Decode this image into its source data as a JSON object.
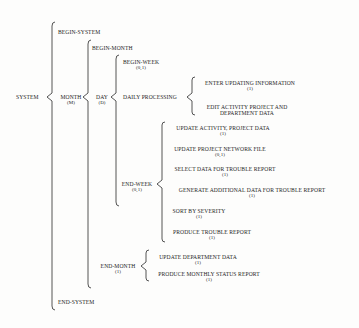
{
  "diagram": {
    "type": "Warnier-Orr diagram",
    "root": {
      "label": "SYSTEM"
    },
    "system": {
      "begin": "BEGIN-SYSTEM",
      "month": {
        "label": "MONTH",
        "rep": "(M)"
      },
      "end": "END-SYSTEM"
    },
    "month": {
      "begin": "BEGIN-MONTH",
      "day": {
        "label": "DAY",
        "rep": "(D)"
      },
      "end_month": {
        "label": "END-MONTH",
        "rep": "(1)"
      }
    },
    "day": {
      "begin_week": {
        "label": "BEGIN-WEEK",
        "rep": "(0,1)"
      },
      "daily_processing": {
        "label": "DAILY PROCESSING"
      },
      "end_week": {
        "label": "END-WEEK",
        "rep": "(0,1)"
      }
    },
    "daily_processing": {
      "items": [
        {
          "label": "ENTER UPDATING INFORMATION",
          "rep": "(1)"
        },
        {
          "label": "EDIT ACTIVITY PROJECT AND",
          "label2": "DEPARTMENT DATA"
        }
      ]
    },
    "end_week": {
      "items": [
        {
          "label": "UPDATE ACTIVITY, PROJECT DATA",
          "rep": "(1)"
        },
        {
          "label": "UPDATE PROJECT NETWORK FILE",
          "rep": "(0,1)"
        },
        {
          "label": "SELECT DATA FOR TROUBLE REPORT",
          "rep": "(1)"
        },
        {
          "label": "GENERATE ADDITIONAL DATA FOR TROUBLE REPORT",
          "rep": "(1)"
        },
        {
          "label": "SORT BY SEVERITY",
          "rep": "(1)"
        },
        {
          "label": "PRODUCE TROUBLE REPORT",
          "rep": "(1)"
        }
      ]
    },
    "end_month": {
      "items": [
        {
          "label": "UPDATE DEPARTMENT DATA",
          "rep": "(1)"
        },
        {
          "label": "PRODUCE MONTHLY STATUS REPORT",
          "rep": "(1)"
        }
      ]
    }
  }
}
